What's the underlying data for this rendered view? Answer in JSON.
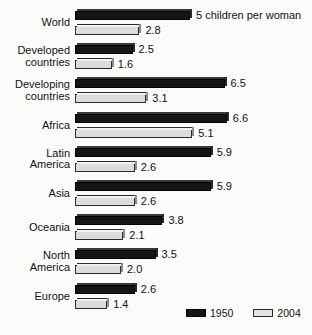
{
  "chart_data": {
    "type": "bar",
    "orientation": "horizontal",
    "title": "",
    "xlabel": "",
    "ylabel": "",
    "unit": "children per woman",
    "annotation": "5 children per woman",
    "annotation_series": "1950",
    "annotation_category": "World",
    "xlim": [
      0,
      6.6
    ],
    "grid": false,
    "legend_position": "bottom-right",
    "categories": [
      "World",
      "Developed\ncountries",
      "Developing\ncountries",
      "Africa",
      "Latin\nAmerica",
      "Asia",
      "Oceania",
      "North\nAmerica",
      "Europe"
    ],
    "series": [
      {
        "name": "1950",
        "color": "#151515",
        "values": [
          5.0,
          2.5,
          6.5,
          6.6,
          5.9,
          5.9,
          3.8,
          3.5,
          2.6
        ],
        "labels": [
          "5 children per woman",
          "2.5",
          "6.5",
          "6.6",
          "5.9",
          "5.9",
          "3.8",
          "3.5",
          "2.6"
        ]
      },
      {
        "name": "2004",
        "color": "#dcdcdc",
        "values": [
          2.8,
          1.6,
          3.1,
          5.1,
          2.6,
          2.6,
          2.1,
          2.0,
          1.4
        ],
        "labels": [
          "2.8",
          "1.6",
          "3.1",
          "5.1",
          "2.6",
          "2.6",
          "2.1",
          "2.0",
          "1.4"
        ]
      }
    ]
  },
  "legend": {
    "items": [
      {
        "label": "1950",
        "swatch": "dark"
      },
      {
        "label": "2004",
        "swatch": "light"
      }
    ]
  }
}
